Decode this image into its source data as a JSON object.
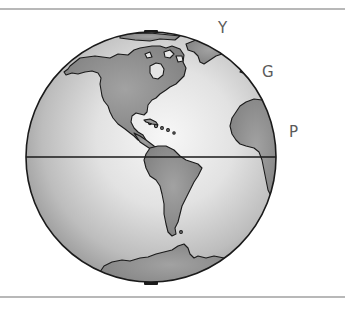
{
  "figure": {
    "labels": [
      {
        "id": "Y",
        "text": "Y"
      },
      {
        "id": "G",
        "text": "G"
      },
      {
        "id": "P",
        "text": "P"
      }
    ],
    "features": {
      "equator_line": "equator",
      "north_cap": "north-pole-cap",
      "south_cap": "south-pole-cap",
      "continents": [
        "North America",
        "South America",
        "Greenland",
        "Africa",
        "Europe",
        "Antarctica"
      ]
    },
    "colors": {
      "ocean_highlight": "#f4f4f4",
      "ocean_shade": "#9a9a9a",
      "land": "#8c8c8c",
      "outline": "#1a1a1a",
      "label": "#5a5a5a",
      "rule": "#b8b8b8"
    }
  }
}
